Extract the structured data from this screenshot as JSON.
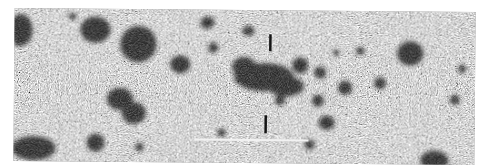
{
  "image": {
    "kind": "astronomical grayscale field, noisy background",
    "width": 461,
    "height": 153,
    "background_gray": "#9a9a9a",
    "source_color": "#1a1a1a",
    "scale_bar": {
      "x1": 181,
      "x2": 295,
      "y": 130,
      "color": "#f2f2f2"
    },
    "markers": [
      {
        "name": "top-marker",
        "x": 256,
        "y1": 24,
        "y2": 41
      },
      {
        "name": "bottom-marker",
        "x": 252,
        "y1": 105,
        "y2": 123
      }
    ],
    "sources": [
      {
        "cx": 6,
        "cy": 22,
        "rx": 12,
        "ry": 16
      },
      {
        "cx": 81,
        "cy": 21,
        "rx": 15,
        "ry": 13
      },
      {
        "cx": 124,
        "cy": 35,
        "rx": 18,
        "ry": 18
      },
      {
        "cx": 166,
        "cy": 55,
        "rx": 10,
        "ry": 9
      },
      {
        "cx": 193,
        "cy": 13,
        "rx": 7,
        "ry": 6
      },
      {
        "cx": 199,
        "cy": 38,
        "rx": 5,
        "ry": 5
      },
      {
        "cx": 234,
        "cy": 21,
        "rx": 6,
        "ry": 5
      },
      {
        "cx": 106,
        "cy": 90,
        "rx": 13,
        "ry": 11
      },
      {
        "cx": 120,
        "cy": 104,
        "rx": 12,
        "ry": 11
      },
      {
        "cx": 20,
        "cy": 140,
        "rx": 22,
        "ry": 12
      },
      {
        "cx": 82,
        "cy": 134,
        "rx": 9,
        "ry": 9
      },
      {
        "cx": 126,
        "cy": 138,
        "rx": 4,
        "ry": 4
      },
      {
        "cx": 250,
        "cy": 67,
        "rx": 30,
        "ry": 14
      },
      {
        "cx": 230,
        "cy": 57,
        "rx": 12,
        "ry": 10
      },
      {
        "cx": 272,
        "cy": 76,
        "rx": 18,
        "ry": 10
      },
      {
        "cx": 286,
        "cy": 55,
        "rx": 8,
        "ry": 8
      },
      {
        "cx": 306,
        "cy": 62,
        "rx": 6,
        "ry": 6
      },
      {
        "cx": 304,
        "cy": 90,
        "rx": 6,
        "ry": 6
      },
      {
        "cx": 331,
        "cy": 77,
        "rx": 7,
        "ry": 7
      },
      {
        "cx": 313,
        "cy": 112,
        "rx": 8,
        "ry": 7
      },
      {
        "cx": 296,
        "cy": 134,
        "rx": 5,
        "ry": 5
      },
      {
        "cx": 396,
        "cy": 42,
        "rx": 13,
        "ry": 12
      },
      {
        "cx": 366,
        "cy": 72,
        "rx": 6,
        "ry": 6
      },
      {
        "cx": 346,
        "cy": 40,
        "rx": 4,
        "ry": 4
      },
      {
        "cx": 441,
        "cy": 88,
        "rx": 5,
        "ry": 5
      },
      {
        "cx": 448,
        "cy": 57,
        "rx": 4,
        "ry": 4
      },
      {
        "cx": 421,
        "cy": 149,
        "rx": 14,
        "ry": 10
      },
      {
        "cx": 208,
        "cy": 123,
        "rx": 4,
        "ry": 4
      },
      {
        "cx": 266,
        "cy": 90,
        "rx": 5,
        "ry": 5
      },
      {
        "cx": 322,
        "cy": 42,
        "rx": 3,
        "ry": 3
      },
      {
        "cx": 58,
        "cy": 8,
        "rx": 4,
        "ry": 3
      }
    ]
  }
}
